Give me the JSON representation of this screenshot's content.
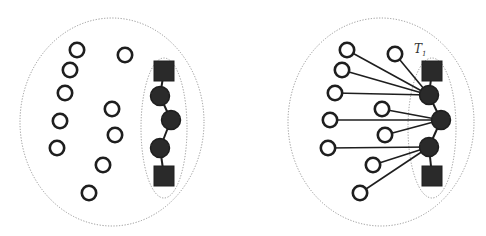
{
  "figure": {
    "panels": [
      {
        "id": "left",
        "description": "Unconnected open nodes beside a chain of filled nodes enclosed by a sub-region",
        "has_edges_to_chain": false,
        "label": null
      },
      {
        "id": "right",
        "description": "Open nodes each connected to a filled node of the chain",
        "has_edges_to_chain": true,
        "label": {
          "main": "T",
          "sub": "1"
        }
      }
    ],
    "open_node_count": 10,
    "chain": [
      "square",
      "filled-circle",
      "filled-circle",
      "filled-circle",
      "square"
    ],
    "connections": {
      "hub_1": [
        0,
        1,
        2,
        3
      ],
      "hub_2": [
        4,
        5,
        6
      ],
      "hub_3": [
        7,
        8,
        9
      ]
    }
  },
  "colors": {
    "node_stroke": "#1e1e1e",
    "node_fill": "#2a2a2a",
    "region_outline": "#8a8a8a",
    "background": "#ffffff"
  }
}
